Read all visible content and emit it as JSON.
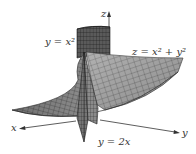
{
  "figure": {
    "type": "3d-surface-plot",
    "axes": {
      "x_label": "x",
      "y_label": "y",
      "z_label": "z"
    },
    "surfaces": [
      {
        "name": "paraboloid",
        "equation": "z = x² + y²",
        "label_lhs": "z",
        "label_rhs": "x² + y²"
      },
      {
        "name": "parabolic-cylinder",
        "equation": "y = x²",
        "label_lhs": "y",
        "label_rhs": "x²"
      },
      {
        "name": "plane",
        "equation": "y = 2x",
        "label_lhs": "y",
        "label_rhs": "2x"
      }
    ],
    "labels": {
      "paraboloid": "z = x² + y²",
      "cylinder": "y = x²",
      "plane": "y = 2x"
    },
    "colors": {
      "paraboloid_fill": "#9a9a9a",
      "cylinder_fill": "#4a4a4a",
      "plane_fill": "#7a7a7a",
      "mesh_line": "#2b2b2b",
      "axis": "#333333",
      "background": "#ffffff"
    }
  }
}
